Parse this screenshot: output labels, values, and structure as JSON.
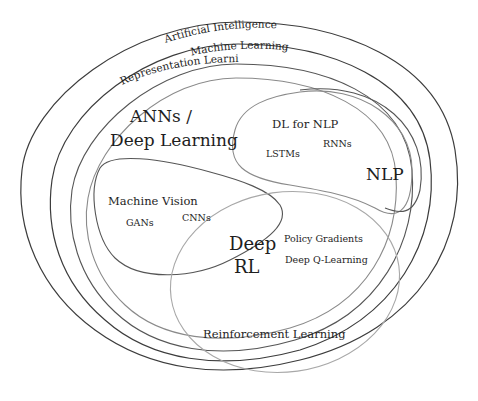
{
  "diagram": {
    "type": "nested-venn",
    "regions": {
      "ai": {
        "label": "Artificial Intelligence"
      },
      "ml": {
        "label": "Machine Learning"
      },
      "rep": {
        "label": "Representation Learning"
      },
      "dl": {
        "label_line1": "ANNs /",
        "label_line2": "Deep Learning"
      },
      "dlnlp": {
        "label": "DL for NLP",
        "items": [
          "LSTMs",
          "RNNs"
        ]
      },
      "nlp": {
        "label": "NLP"
      },
      "mv": {
        "label": "Machine Vision",
        "items": [
          "GANs",
          "CNNs"
        ]
      },
      "drl": {
        "label_line1": "Deep",
        "label_line2": "RL"
      },
      "rl": {
        "label": "Reinforcement Learning",
        "items": [
          "Policy Gradients",
          "Deep Q-Learning"
        ]
      }
    },
    "colors": {
      "outer_ring": "#3c3c3c",
      "inner_ring": "#8a8a8a",
      "text": "#1e1e1e",
      "background": "#ffffff"
    }
  }
}
